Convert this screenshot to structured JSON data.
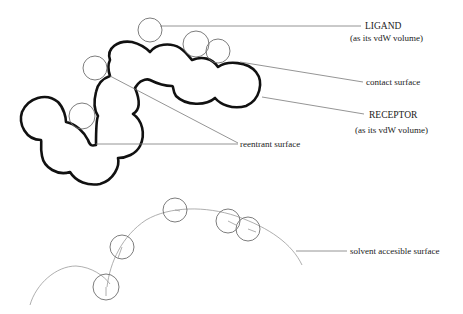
{
  "diagram": {
    "type": "molecular-surface-schematic",
    "labels": {
      "ligand": {
        "title": "LIGAND",
        "subtitle": "(as its vdW volume)"
      },
      "contact_surface": "contact surface",
      "receptor": {
        "title": "RECEPTOR",
        "subtitle": "(as its vdW volume)"
      },
      "reentrant_surface": "reentrant surface",
      "solvent_accessible_surface": "solvent accesible surface"
    },
    "colors": {
      "receptor_outline": "#111111",
      "probe_circle": "#6e6e6e",
      "leader_line": "#7a7a7a",
      "sas_arc": "#9a9a9a",
      "text": "#1a1a1a",
      "background": "#ffffff"
    },
    "probe_spheres_top": [
      {
        "cx": 150,
        "cy": 30,
        "r": 12
      },
      {
        "cx": 196,
        "cy": 44,
        "r": 13
      },
      {
        "cx": 218,
        "cy": 51,
        "r": 12
      },
      {
        "cx": 95,
        "cy": 68,
        "r": 12
      },
      {
        "cx": 82,
        "cy": 116,
        "r": 13
      }
    ],
    "probe_spheres_bottom": [
      {
        "cx": 175,
        "cy": 210,
        "r": 12
      },
      {
        "cx": 228,
        "cy": 221,
        "r": 12
      },
      {
        "cx": 248,
        "cy": 229,
        "r": 12
      },
      {
        "cx": 122,
        "cy": 247,
        "r": 12
      },
      {
        "cx": 106,
        "cy": 287,
        "r": 13
      }
    ]
  }
}
